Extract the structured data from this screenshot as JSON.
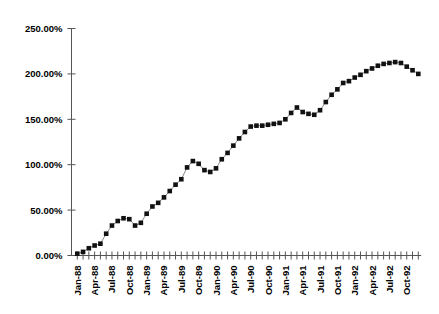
{
  "chart_data": {
    "type": "line",
    "title": "",
    "subtitle": "",
    "xlabel": "",
    "ylabel": "",
    "grid": false,
    "legend": false,
    "marker_style": "filled-square",
    "ylim": [
      0,
      250
    ],
    "ytick_values": [
      0,
      50,
      100,
      150,
      200,
      250
    ],
    "ytick_labels": [
      "0.00%",
      "50.00%",
      "100.00%",
      "150.00%",
      "200.00%",
      "250.00%"
    ],
    "xtick_labels": [
      "Jan-88",
      "Apr-88",
      "Jul-88",
      "Oct-88",
      "Jan-89",
      "Apr-89",
      "Jul-89",
      "Oct-89",
      "Jan-90",
      "Apr-90",
      "Jul-90",
      "Oct-90",
      "Jan-91",
      "Apr-91",
      "Jul-91",
      "Oct-91",
      "Jan-92",
      "Apr-92",
      "Jul-92",
      "Oct-92"
    ],
    "xtick_label_interval": 3,
    "x": [
      "Jan-88",
      "Feb-88",
      "Mar-88",
      "Apr-88",
      "May-88",
      "Jun-88",
      "Jul-88",
      "Aug-88",
      "Sep-88",
      "Oct-88",
      "Nov-88",
      "Dec-88",
      "Jan-89",
      "Feb-89",
      "Mar-89",
      "Apr-89",
      "May-89",
      "Jun-89",
      "Jul-89",
      "Aug-89",
      "Sep-89",
      "Oct-89",
      "Nov-89",
      "Dec-89",
      "Jan-90",
      "Feb-90",
      "Mar-90",
      "Apr-90",
      "May-90",
      "Jun-90",
      "Jul-90",
      "Aug-90",
      "Sep-90",
      "Oct-90",
      "Nov-90",
      "Dec-90",
      "Jan-91",
      "Feb-91",
      "Mar-91",
      "Apr-91",
      "May-91",
      "Jun-91",
      "Jul-91",
      "Aug-91",
      "Sep-91",
      "Oct-91",
      "Nov-91",
      "Dec-91",
      "Jan-92",
      "Feb-92",
      "Mar-92",
      "Apr-92",
      "May-92",
      "Jun-92",
      "Jul-92",
      "Aug-92",
      "Sep-92",
      "Oct-92",
      "Nov-92",
      "Dec-92"
    ],
    "values": [
      2,
      4,
      8,
      11,
      13,
      24,
      33,
      38,
      41,
      40,
      33,
      36,
      46,
      54,
      58,
      64,
      71,
      78,
      84,
      97,
      104,
      101,
      94,
      92,
      96,
      106,
      113,
      121,
      129,
      136,
      142,
      143,
      143,
      144,
      145,
      146,
      150,
      157,
      163,
      158,
      156,
      155,
      160,
      169,
      177,
      183,
      190,
      192,
      196,
      199,
      203,
      206,
      209,
      211,
      212,
      213,
      212,
      208,
      204,
      200
    ]
  },
  "axes": {
    "y_axis_name": "percent-axis",
    "x_axis_name": "date-axis"
  }
}
